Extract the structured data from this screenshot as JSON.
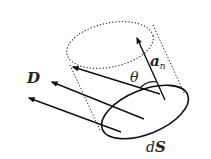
{
  "diagram": {
    "labels": {
      "D": "D",
      "theta": "θ",
      "an_a": "a",
      "an_sub": "n",
      "dS_d": "d",
      "dS_S": "S"
    },
    "colors": {
      "stroke": "#111111",
      "label": "#222222",
      "background": "#ffffff"
    }
  }
}
